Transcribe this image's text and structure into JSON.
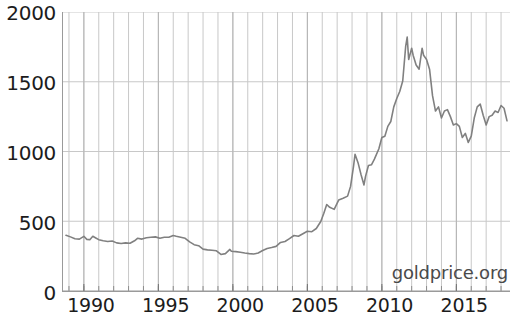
{
  "chart_data": {
    "type": "line",
    "title": "",
    "subtitle": "",
    "xlabel": "",
    "ylabel": "",
    "xlim": [
      1988.6,
      2018.6
    ],
    "ylim": [
      0,
      2000
    ],
    "grid": true,
    "grid_x": "every year",
    "grid_y": "every 500",
    "legend": "none",
    "line_color": "#808080",
    "axis_color": "#9a9a9a",
    "grid_color": "#c8c8c8",
    "background": "#ffffff",
    "annotations": [
      {
        "name": "watermark",
        "text": "goldprice.org",
        "position": "bottom-right"
      }
    ],
    "y_ticks": [
      0,
      500,
      1000,
      1500,
      2000
    ],
    "y_tick_labels": [
      "0",
      "500",
      "1000",
      "1500",
      "2000"
    ],
    "x_ticks": [
      1990,
      1995,
      2000,
      2005,
      2010,
      2015
    ],
    "x_tick_labels": [
      "1990",
      "1995",
      "2000",
      "2005",
      "2010",
      "2015"
    ],
    "series": [
      {
        "name": "Gold price (USD per ounce)",
        "color": "#808080",
        "x": [
          1988.8,
          1989.1,
          1989.4,
          1989.7,
          1990.0,
          1990.2,
          1990.4,
          1990.6,
          1990.8,
          1991.0,
          1991.3,
          1991.6,
          1991.9,
          1992.2,
          1992.5,
          1992.8,
          1993.1,
          1993.4,
          1993.6,
          1993.9,
          1994.2,
          1994.5,
          1994.8,
          1995.1,
          1995.4,
          1995.7,
          1996.0,
          1996.2,
          1996.5,
          1996.8,
          1997.1,
          1997.4,
          1997.7,
          1998.0,
          1998.3,
          1998.6,
          1998.9,
          1999.2,
          1999.5,
          1999.8,
          1999.9,
          2000.2,
          2000.5,
          2000.8,
          2001.1,
          2001.4,
          2001.7,
          2002.0,
          2002.3,
          2002.6,
          2002.9,
          2003.2,
          2003.5,
          2003.8,
          2004.1,
          2004.4,
          2004.7,
          2005.0,
          2005.3,
          2005.6,
          2005.9,
          2006.1,
          2006.3,
          2006.5,
          2006.8,
          2007.1,
          2007.4,
          2007.7,
          2007.9,
          2008.1,
          2008.2,
          2008.4,
          2008.6,
          2008.8,
          2008.9,
          2009.1,
          2009.3,
          2009.5,
          2009.8,
          2010.0,
          2010.2,
          2010.4,
          2010.6,
          2010.8,
          2011.0,
          2011.2,
          2011.4,
          2011.6,
          2011.7,
          2011.8,
          2011.9,
          2012.0,
          2012.1,
          2012.3,
          2012.5,
          2012.7,
          2012.8,
          2013.0,
          2013.2,
          2013.4,
          2013.6,
          2013.8,
          2014.0,
          2014.2,
          2014.4,
          2014.6,
          2014.8,
          2015.0,
          2015.2,
          2015.4,
          2015.6,
          2015.8,
          2016.0,
          2016.2,
          2016.4,
          2016.6,
          2016.8,
          2017.0,
          2017.2,
          2017.4,
          2017.6,
          2017.8,
          2018.0,
          2018.2,
          2018.4
        ],
        "y": [
          400,
          388,
          374,
          372,
          392,
          370,
          368,
          392,
          380,
          368,
          360,
          355,
          358,
          345,
          340,
          345,
          342,
          360,
          378,
          372,
          382,
          385,
          388,
          378,
          385,
          385,
          398,
          392,
          385,
          378,
          352,
          332,
          325,
          300,
          295,
          292,
          288,
          262,
          268,
          298,
          285,
          282,
          278,
          272,
          268,
          265,
          272,
          290,
          305,
          312,
          320,
          348,
          355,
          375,
          398,
          392,
          410,
          428,
          425,
          448,
          498,
          555,
          620,
          600,
          585,
          652,
          665,
          680,
          750,
          895,
          980,
          920,
          835,
          760,
          820,
          900,
          905,
          945,
          1020,
          1100,
          1110,
          1180,
          1215,
          1320,
          1380,
          1430,
          1505,
          1755,
          1820,
          1660,
          1700,
          1740,
          1690,
          1620,
          1590,
          1740,
          1690,
          1660,
          1590,
          1400,
          1290,
          1320,
          1240,
          1290,
          1300,
          1250,
          1190,
          1200,
          1180,
          1100,
          1130,
          1065,
          1110,
          1240,
          1320,
          1340,
          1260,
          1190,
          1250,
          1260,
          1290,
          1280,
          1330,
          1310,
          1220
        ]
      }
    ]
  }
}
